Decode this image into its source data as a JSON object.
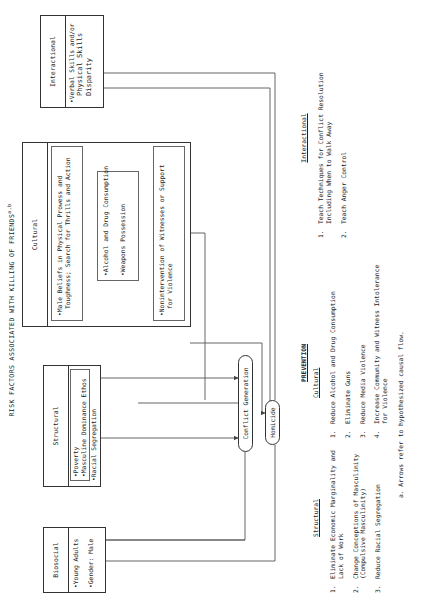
{
  "title": {
    "text": "RISK FACTORS ASSOCIATED WITH KILLING OF FRIENDS",
    "superscript": "a,b"
  },
  "risk_factors": {
    "biosocial": {
      "header": "Biosocial",
      "items": [
        "Young Adults",
        "Gender: Male"
      ]
    },
    "structural": {
      "header": "Structural",
      "inner_items": [
        "Poverty",
        "Masculine Dominance Ethos"
      ],
      "items": [
        "Racial Segregation"
      ]
    },
    "cultural": {
      "header": "Cultural",
      "group1": [
        "Male Beliefs in Physical Prowess and",
        "Toughness; Search for Thrills and Action"
      ],
      "group2": [
        "Alcohol and Drug Consumption",
        "Weapons Possession"
      ],
      "group3": [
        "Nonintervention of Witnesses or Support",
        "for Violence"
      ]
    },
    "interactional": {
      "header": "Interactional",
      "items": [
        "Verbal Skills and/or",
        "Physical Skills",
        "Disparity"
      ]
    }
  },
  "outcomes": {
    "conflict_generation": "Conflict Generation",
    "homicide": "Homicide"
  },
  "prevention": {
    "title": "PREVENTION",
    "structural": {
      "header": "Structural",
      "items": [
        {
          "num": "1.",
          "line1": "Eliminate Economic Marginality and",
          "line2": "Lack of Work"
        },
        {
          "num": "2.",
          "line1": "Change Conceptions of Masculinity",
          "line2": "(Compulsive Masculinity)"
        },
        {
          "num": "3.",
          "line1": "Reduce Racial Segregation",
          "line2": ""
        }
      ]
    },
    "cultural": {
      "header": "Cultural",
      "items": [
        {
          "num": "1.",
          "line1": "Reduce Alcohol and Drug Consumption",
          "line2": ""
        },
        {
          "num": "2.",
          "line1": "Eliminate Guns",
          "line2": ""
        },
        {
          "num": "3.",
          "line1": "Reduce Media Violence",
          "line2": ""
        },
        {
          "num": "4.",
          "line1": "Increase Community and Witness Intolerance",
          "line2": "for Violence"
        }
      ]
    },
    "interactional": {
      "header": "Interactional",
      "items": [
        {
          "num": "1.",
          "line1": "Teach Techniques for Conflict Resolution",
          "line2": "Including When to Walk Away"
        },
        {
          "num": "2.",
          "line1": "Teach Anger Control",
          "line2": ""
        }
      ]
    }
  },
  "footnote": "a. Arrows refer to hypothesized causal flow."
}
